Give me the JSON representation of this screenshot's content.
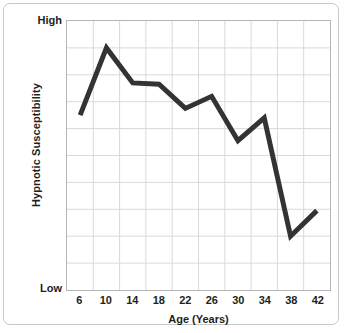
{
  "chart_data": {
    "type": "line",
    "title": "",
    "xlabel": "Age (Years)",
    "ylabel": "Hypnotic Susceptibility",
    "x": [
      6,
      10,
      14,
      18,
      22,
      26,
      30,
      34,
      38,
      42
    ],
    "categories": [
      "6",
      "10",
      "14",
      "18",
      "22",
      "26",
      "30",
      "34",
      "38",
      "42"
    ],
    "values": [
      6.5,
      9.0,
      7.7,
      7.65,
      6.75,
      7.2,
      5.55,
      6.4,
      2.0,
      2.95
    ],
    "ylim": [
      0,
      10
    ],
    "ytick_labels": [
      "High",
      "Low"
    ],
    "ytick_high": "High",
    "ytick_low": "Low",
    "grid": true,
    "grid_rows": 10,
    "grid_cols": 10,
    "legend": "none",
    "series": [
      {
        "name": "Hypnotic Susceptibility",
        "color": "#333333",
        "line_width": 5,
        "values": [
          6.5,
          9.0,
          7.7,
          7.65,
          6.75,
          7.2,
          5.55,
          6.4,
          2.0,
          2.95
        ]
      }
    ],
    "annotations": []
  },
  "colors": {
    "line": "#333333",
    "grid": "#d9d9d9",
    "axis_border": "#b5b5b5",
    "card_border": "#c8c8c8",
    "text": "#231f20",
    "background": "#ffffff"
  }
}
